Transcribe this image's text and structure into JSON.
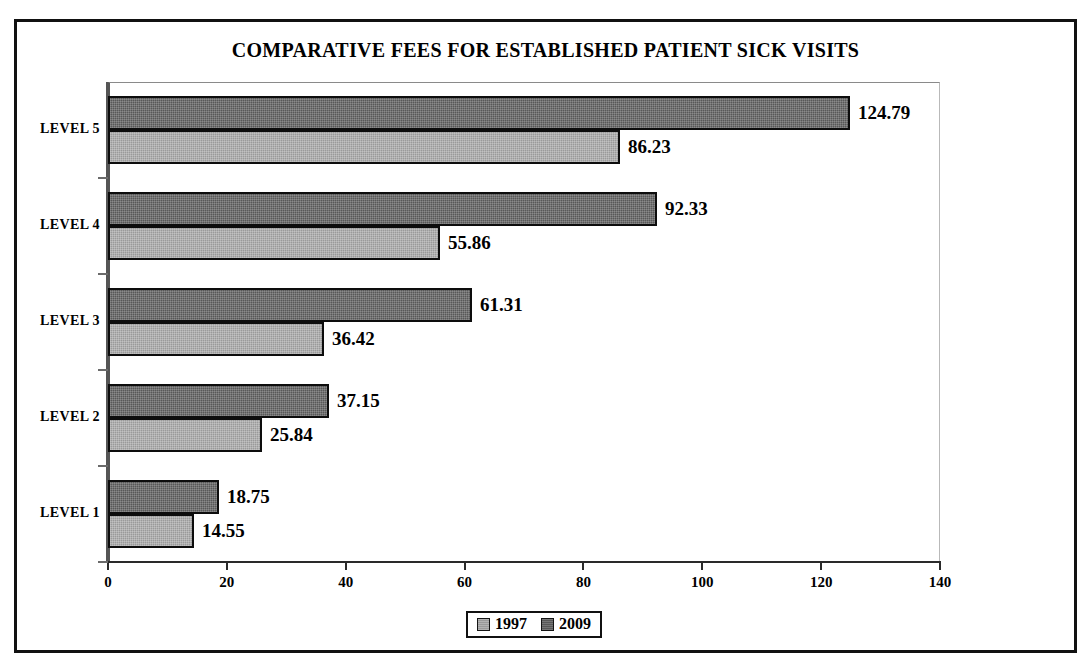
{
  "chart_data": {
    "type": "bar",
    "orientation": "horizontal",
    "title": "COMPARATIVE FEES FOR ESTABLISHED PATIENT SICK VISITS",
    "xlabel": "",
    "ylabel": "",
    "categories": [
      "LEVEL 1",
      "LEVEL 2",
      "LEVEL 3",
      "LEVEL 4",
      "LEVEL 5"
    ],
    "category_order_top_to_bottom": [
      "LEVEL 5",
      "LEVEL 4",
      "LEVEL 3",
      "LEVEL 2",
      "LEVEL 1"
    ],
    "series": [
      {
        "name": "1997",
        "color": "#9a9a9a",
        "values": [
          14.55,
          25.84,
          36.42,
          55.86,
          86.23
        ]
      },
      {
        "name": "2009",
        "color": "#585858",
        "values": [
          18.75,
          37.15,
          61.31,
          92.33,
          124.79
        ]
      }
    ],
    "xlim": [
      0,
      140
    ],
    "xticks": [
      0,
      20,
      40,
      60,
      80,
      100,
      120,
      140
    ],
    "xtick_labels": [
      "0",
      "20",
      "40",
      "60",
      "80",
      "100",
      "120",
      "140"
    ],
    "grid": false,
    "data_labels": true,
    "legend": {
      "position": "bottom",
      "entries": [
        {
          "label": "1997",
          "swatch": "light-gray"
        },
        {
          "label": "2009",
          "swatch": "dark-gray"
        }
      ]
    }
  },
  "groups": [
    {
      "category": "LEVEL 5",
      "bars": [
        {
          "series": "2009",
          "value": 124.79,
          "label": "124.79"
        },
        {
          "series": "1997",
          "value": 86.23,
          "label": "86.23"
        }
      ]
    },
    {
      "category": "LEVEL 4",
      "bars": [
        {
          "series": "2009",
          "value": 92.33,
          "label": "92.33"
        },
        {
          "series": "1997",
          "value": 55.86,
          "label": "55.86"
        }
      ]
    },
    {
      "category": "LEVEL 3",
      "bars": [
        {
          "series": "2009",
          "value": 61.31,
          "label": "61.31"
        },
        {
          "series": "1997",
          "value": 36.42,
          "label": "36.42"
        }
      ]
    },
    {
      "category": "LEVEL 2",
      "bars": [
        {
          "series": "2009",
          "value": 37.15,
          "label": "37.15"
        },
        {
          "series": "1997",
          "value": 25.84,
          "label": "25.84"
        }
      ]
    },
    {
      "category": "LEVEL 1",
      "bars": [
        {
          "series": "2009",
          "value": 18.75,
          "label": "18.75"
        },
        {
          "series": "1997",
          "value": 14.55,
          "label": "14.55"
        }
      ]
    }
  ]
}
